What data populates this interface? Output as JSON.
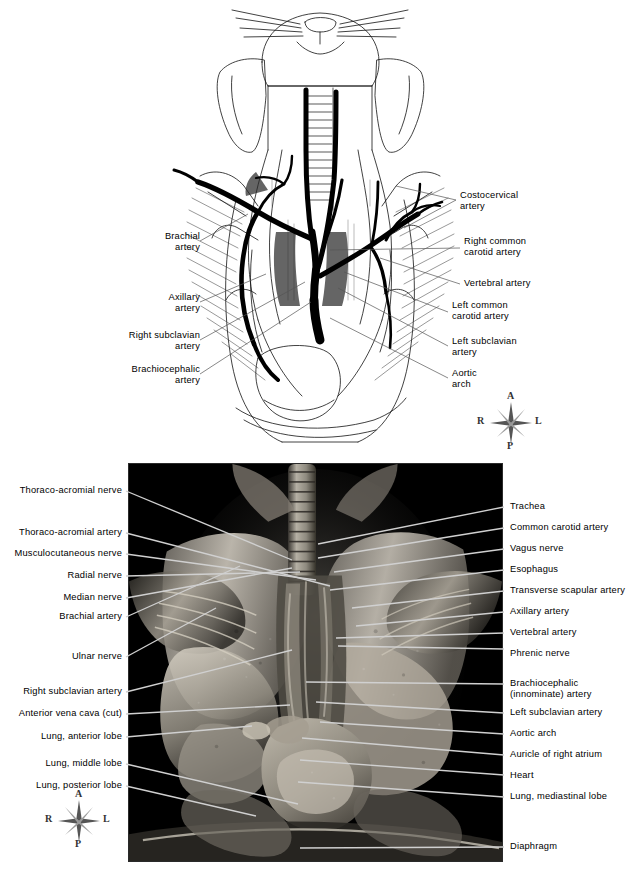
{
  "figure": {
    "type": "anatomical-plate",
    "panels": [
      {
        "id": "top",
        "kind": "line-drawing"
      },
      {
        "id": "bottom",
        "kind": "dissection-photograph"
      }
    ]
  },
  "orientation_compass": {
    "anterior": "A",
    "posterior": "P",
    "right": "R",
    "left": "L"
  },
  "top_panel": {
    "labels_left": [
      {
        "text": "Brachial\nartery",
        "lines": [
          "Brachial",
          "artery"
        ]
      },
      {
        "text": "Axillary\nartery",
        "lines": [
          "Axillary",
          "artery"
        ]
      },
      {
        "text": "Right subclavian\nartery",
        "lines": [
          "Right subclavian",
          "artery"
        ]
      },
      {
        "text": "Brachiocephalic\nartery",
        "lines": [
          "Brachiocephalic",
          "artery"
        ]
      }
    ],
    "labels_right": [
      {
        "text": "Costocervical\nartery",
        "lines": [
          "Costocervical",
          "artery"
        ]
      },
      {
        "text": "Right common\ncarotid artery",
        "lines": [
          "Right common",
          "carotid artery"
        ]
      },
      {
        "text": "Vertebral artery",
        "lines": [
          "Vertebral artery"
        ]
      },
      {
        "text": "Left common\ncarotid artery",
        "lines": [
          "Left common",
          "carotid artery"
        ]
      },
      {
        "text": "Left subclavian\nartery",
        "lines": [
          "Left subclavian",
          "artery"
        ]
      },
      {
        "text": "Aortic\narch",
        "lines": [
          "Aortic",
          "arch"
        ]
      }
    ]
  },
  "bottom_panel": {
    "labels_left": [
      {
        "text": "Thoraco-acromial nerve"
      },
      {
        "text": "Thoraco-acromial artery"
      },
      {
        "text": "Musculocutaneous nerve"
      },
      {
        "text": "Radial nerve"
      },
      {
        "text": "Median nerve"
      },
      {
        "text": "Brachial artery"
      },
      {
        "text": "Ulnar nerve"
      },
      {
        "text": "Right subclavian artery"
      },
      {
        "text": "Anterior vena cava (cut)"
      },
      {
        "text": "Lung, anterior lobe"
      },
      {
        "text": "Lung, middle lobe"
      },
      {
        "text": "Lung, posterior lobe"
      }
    ],
    "labels_right": [
      {
        "text": "Trachea"
      },
      {
        "text": "Common carotid artery"
      },
      {
        "text": "Vagus nerve"
      },
      {
        "text": "Esophagus"
      },
      {
        "text": "Transverse scapular artery"
      },
      {
        "text": "Axillary artery"
      },
      {
        "text": "Vertebral artery"
      },
      {
        "text": "Phrenic nerve"
      },
      {
        "text": "Brachiocephalic\n(innominate) artery",
        "lines": [
          "Brachiocephalic",
          "(innominate) artery"
        ]
      },
      {
        "text": "Left subclavian artery"
      },
      {
        "text": "Aortic arch"
      },
      {
        "text": "Auricle of right atrium"
      },
      {
        "text": "Heart"
      },
      {
        "text": "Lung, mediastinal lobe"
      },
      {
        "text": "Diaphragm"
      }
    ]
  },
  "colors": {
    "background": "#ffffff",
    "ink": "#000000",
    "photo_background": "#000000",
    "leader_line_top": "#555555",
    "leader_line_bottom": "#d8d8d8",
    "compass": "#444444"
  }
}
